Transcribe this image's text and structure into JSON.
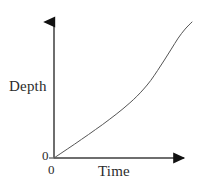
{
  "chart_data": {
    "type": "line",
    "title": "",
    "subtitle": "",
    "xlabel": "Time",
    "ylabel": "Depth",
    "origin_label_y": "0",
    "origin_label_x": "0",
    "grid": false,
    "legend": null,
    "axis_arrows": true,
    "xlim": [
      0,
      10
    ],
    "ylim": [
      0,
      10
    ],
    "xticks": [
      0
    ],
    "yticks": [
      0
    ],
    "xticklabels": [
      "0"
    ],
    "yticklabels": [
      "0"
    ],
    "annotations": [],
    "series": [
      {
        "name": "Depth vs Time",
        "color": "#555555",
        "linewidth": 1,
        "x": [
          0.0,
          0.5,
          1.0,
          1.5,
          2.0,
          2.5,
          3.0,
          3.5,
          4.0,
          4.5,
          5.0,
          5.5,
          6.0,
          6.5,
          7.0,
          7.5,
          8.0,
          8.5,
          9.0,
          9.5,
          10.0
        ],
        "y": [
          0.0,
          0.36,
          0.72,
          1.08,
          1.45,
          1.82,
          2.2,
          2.58,
          2.98,
          3.39,
          3.82,
          4.28,
          4.78,
          5.35,
          6.0,
          6.78,
          7.6,
          8.45,
          9.3,
          10.0,
          10.55
        ]
      }
    ]
  },
  "figure": {
    "background_color": "#ffffff",
    "axis_color": "#6e6e6e",
    "arrow_color": "#111111",
    "text_color": "#2b2b2b"
  }
}
